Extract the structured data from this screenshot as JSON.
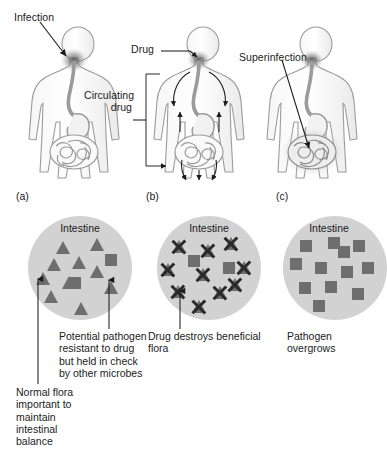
{
  "figure": {
    "colors": {
      "circle_fill": "#d2d2d2",
      "microbe_fill": "#6e6e6e",
      "x_mark": "#2a2a2a",
      "body_outline": "#8c8c8c",
      "text": "#1b1b1b",
      "leader_line": "#1b1b1b"
    }
  },
  "panels": [
    {
      "letter": "(a)",
      "annotations": [
        {
          "name": "infection-label",
          "text": "Infection"
        }
      ],
      "circle": {
        "title": "Intestine",
        "triangles": 10,
        "squares": 2,
        "x_marks": 0
      },
      "callouts": [
        {
          "name": "normal-flora-callout",
          "text": "Normal flora\nimportant to\nmaintain\nintestinal\nbalance"
        },
        {
          "name": "potential-pathogen-callout",
          "text": "Potential pathogen\nresistant to drug\nbut held in check\nby other microbes"
        }
      ]
    },
    {
      "letter": "(b)",
      "annotations": [
        {
          "name": "drug-label",
          "text": "Drug"
        },
        {
          "name": "circulating-drug-label",
          "text": "Circulating\ndrug"
        }
      ],
      "circle": {
        "title": "Intestine",
        "triangles": 10,
        "squares": 2,
        "x_marks": 10
      },
      "callouts": [
        {
          "name": "drug-destroys-flora-callout",
          "text": "Drug destroys beneficial\nflora"
        }
      ]
    },
    {
      "letter": "(c)",
      "annotations": [
        {
          "name": "superinfection-label",
          "text": "Superinfection"
        }
      ],
      "circle": {
        "title": "Intestine",
        "triangles": 0,
        "squares": 12,
        "x_marks": 0
      },
      "callouts": [
        {
          "name": "pathogen-overgrows-callout",
          "text": "Pathogen\novergrows"
        }
      ]
    }
  ],
  "legend_text": {
    "intestine": "Intestine",
    "infection": "Infection",
    "drug": "Drug",
    "circulating_drug": "Circulating\ndrug",
    "superinfection": "Superinfection",
    "letter_a": "(a)",
    "letter_b": "(b)",
    "letter_c": "(c)",
    "normal_flora": "Normal flora\nimportant to\nmaintain\nintestinal\nbalance",
    "potential_pathogen": "Potential pathogen\nresistant to drug\nbut held in check\nby other microbes",
    "drug_destroys": "Drug destroys beneficial\nflora",
    "pathogen_overgrows": "Pathogen\novergrows"
  }
}
